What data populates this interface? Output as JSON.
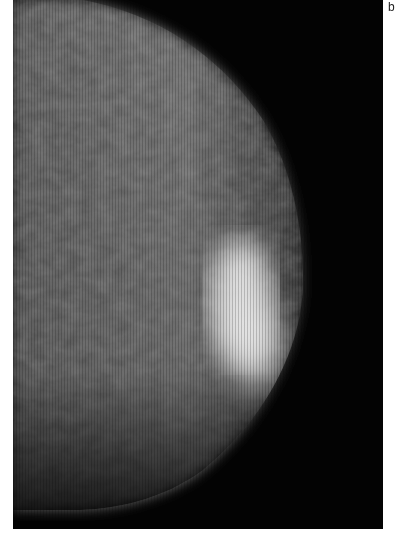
{
  "figure": {
    "panel_label": "b",
    "image": {
      "kind": "grayscale-radiograph",
      "description": "Mammogram-like grayscale image of breast tissue with a bright dense region",
      "colors": {
        "background": "#030303",
        "tissue": "#6a6a6a",
        "tissue_dark": "#3c3c3c",
        "highlight": "#ffffff"
      }
    }
  }
}
